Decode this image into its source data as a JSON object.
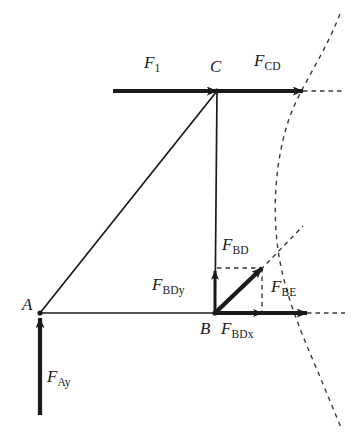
{
  "figure": {
    "kind": "free-body-diagram",
    "width": 356,
    "height": 445,
    "background": "#ffffff",
    "stroke_color": "#1a1a1a",
    "dash_color": "#3a3a3a"
  },
  "points": [
    {
      "id": "A",
      "label": "A",
      "x": 40,
      "y": 313,
      "label_x": 22,
      "label_y": 296
    },
    {
      "id": "B",
      "label": "B",
      "x": 215,
      "y": 313,
      "label_x": 200,
      "label_y": 320
    },
    {
      "id": "C",
      "label": "C",
      "x": 217,
      "y": 91,
      "label_x": 210,
      "label_y": 58
    }
  ],
  "members": [
    {
      "name": "member-A-to-C",
      "from": "A",
      "to": "C"
    },
    {
      "name": "member-A-to-B",
      "from": "A",
      "to": "B"
    },
    {
      "name": "member-C-to-B",
      "from": "C",
      "to": "B"
    }
  ],
  "forces": [
    {
      "id": "F1",
      "name": "force-F1",
      "base": "F",
      "sub": "1",
      "x1": 113,
      "y1": 91,
      "x2": 217,
      "y2": 91,
      "label_x": 144,
      "label_y": 54,
      "weight": "heavy"
    },
    {
      "id": "FCD",
      "name": "force-FCD",
      "base": "F",
      "sub": "CD",
      "x1": 217,
      "y1": 91,
      "x2": 303,
      "y2": 91,
      "label_x": 254,
      "label_y": 52,
      "weight": "heavy"
    },
    {
      "id": "FAy",
      "name": "force-FAy",
      "base": "F",
      "sub": "Ay",
      "x1": 40,
      "y1": 415,
      "x2": 40,
      "y2": 318,
      "label_x": 47,
      "label_y": 368,
      "weight": "heavy"
    },
    {
      "id": "FBD",
      "name": "force-FBD",
      "base": "F",
      "sub": "BD",
      "x1": 215,
      "y1": 313,
      "x2": 262,
      "y2": 268,
      "label_x": 222,
      "label_y": 236,
      "weight": "heavy"
    },
    {
      "id": "FBDy",
      "name": "force-FBDy",
      "base": "F",
      "sub": "BDy",
      "x1": 215,
      "y1": 313,
      "x2": 215,
      "y2": 271,
      "label_x": 152,
      "label_y": 276,
      "weight": "medium"
    },
    {
      "id": "FBDx",
      "name": "force-FBDx",
      "base": "F",
      "sub": "BDx",
      "x1": 215,
      "y1": 313,
      "x2": 262,
      "y2": 313,
      "label_x": 221,
      "label_y": 320,
      "weight": "medium"
    },
    {
      "id": "FBE",
      "name": "force-FBE",
      "base": "F",
      "sub": "BE",
      "x1": 215,
      "y1": 313,
      "x2": 307,
      "y2": 313,
      "label_x": 271,
      "label_y": 278,
      "weight": "heavy"
    }
  ],
  "construction_lines": [
    {
      "name": "dashed-projection-horizontal-bd",
      "x1": 217,
      "y1": 268,
      "x2": 262,
      "y2": 268
    },
    {
      "name": "dashed-projection-vertical-bd",
      "x1": 262,
      "y1": 268,
      "x2": 262,
      "y2": 313
    },
    {
      "name": "dashed-axis-extension-top",
      "x1": 303,
      "y1": 91,
      "x2": 343,
      "y2": 91
    },
    {
      "name": "dashed-axis-extension-bottom",
      "x1": 307,
      "y1": 313,
      "x2": 345,
      "y2": 313
    },
    {
      "name": "dashed-bd-line-of-action",
      "x1": 243,
      "y1": 288,
      "x2": 303,
      "y2": 226
    }
  ],
  "curves": [
    {
      "name": "dashed-reference-curve",
      "path": "M 340 14 C 322 60, 300 86, 288 122 C 276 160, 272 205, 278 250 C 284 292, 300 330, 318 372 L 342 430"
    }
  ]
}
